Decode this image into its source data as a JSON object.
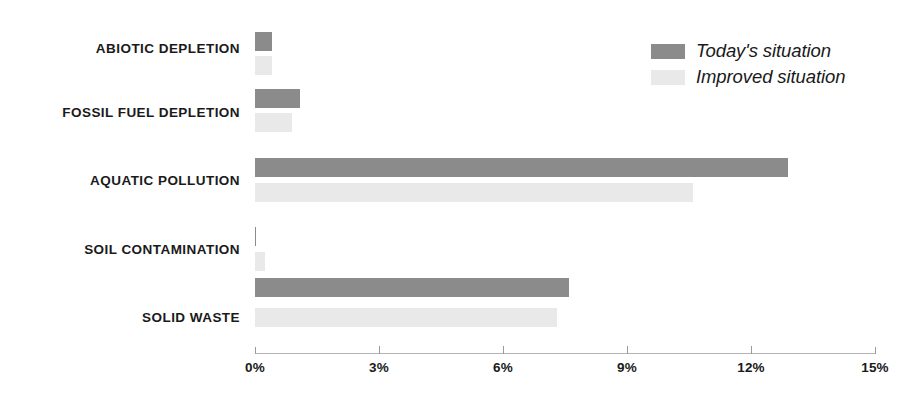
{
  "chart_data": {
    "type": "bar",
    "orientation": "horizontal",
    "title": "",
    "subtitle": "",
    "xlabel": "",
    "ylabel": "",
    "xlim": [
      0,
      15
    ],
    "xticks": [
      0,
      3,
      6,
      9,
      12,
      15
    ],
    "xtick_labels": [
      "0%",
      "3%",
      "6%",
      "9%",
      "12%",
      "15%"
    ],
    "grid": false,
    "legend_position": "top-right",
    "categories": [
      "ABIOTIC DEPLETION",
      "FOSSIL FUEL DEPLETION",
      "AQUATIC POLLUTION",
      "SOIL CONTAMINATION",
      "SOLID WASTE"
    ],
    "series": [
      {
        "name": "Today's situation",
        "color": "#8b8b8b",
        "values": [
          0.4,
          1.1,
          12.9,
          0.03,
          7.6
        ]
      },
      {
        "name": "Improved situation",
        "color": "#e9e9e9",
        "values": [
          0.4,
          0.9,
          10.6,
          0.25,
          7.3
        ]
      }
    ]
  },
  "legend": {
    "items": [
      {
        "label": "Today's situation",
        "swatch": "today"
      },
      {
        "label": "Improved situation",
        "swatch": "improved"
      }
    ]
  },
  "colors": {
    "today": "#8b8b8b",
    "improved": "#e9e9e9",
    "text": "#1a1a1a",
    "axis": "#9a9a9a",
    "background": "#ffffff"
  }
}
